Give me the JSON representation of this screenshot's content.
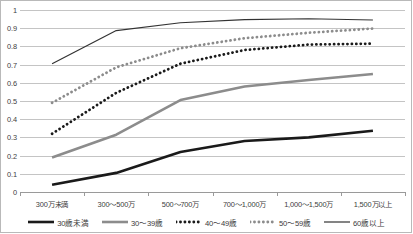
{
  "chart_data": {
    "type": "line",
    "title": "",
    "subtitle": "",
    "xlabel": "",
    "ylabel": "",
    "grid": true,
    "legend_position": "bottom",
    "ylim": [
      0,
      1
    ],
    "ytick_labels": [
      "1",
      "0.9",
      "0.8",
      "0.7",
      "0.6",
      "0.5",
      "0.4",
      "0.3",
      "0.2",
      "0.1",
      "0"
    ],
    "ytick_values": [
      1,
      0.9,
      0.8,
      0.7,
      0.6,
      0.5,
      0.4,
      0.3,
      0.2,
      0.1,
      0
    ],
    "categories": [
      "300万未満",
      "300〜500万",
      "500〜700万",
      "700〜1,000万",
      "1,000〜1,500万",
      "1,500万以上"
    ],
    "series": [
      {
        "name": "30歳未満",
        "values": [
          0.04,
          0.105,
          0.22,
          0.28,
          0.3,
          0.337
        ],
        "color": "#1a1a1a",
        "style": "solid",
        "width": 2.6
      },
      {
        "name": "30〜39歳",
        "values": [
          0.19,
          0.315,
          0.505,
          0.58,
          0.615,
          0.648
        ],
        "color": "#8c8c8c",
        "style": "solid",
        "width": 2.6
      },
      {
        "name": "40〜49歳",
        "values": [
          0.32,
          0.545,
          0.705,
          0.78,
          0.81,
          0.815
        ],
        "color": "#1a1a1a",
        "style": "dotted",
        "width": 2.8
      },
      {
        "name": "50〜59歳",
        "values": [
          0.49,
          0.685,
          0.79,
          0.845,
          0.875,
          0.898
        ],
        "color": "#8c8c8c",
        "style": "dotted",
        "width": 2.8
      },
      {
        "name": "60歳以上",
        "values": [
          0.705,
          0.887,
          0.93,
          0.947,
          0.952,
          0.945
        ],
        "color": "#333333",
        "style": "solid",
        "width": 1.2
      }
    ]
  },
  "colors": {
    "grid": "#c4c4c4",
    "axis": "#9a9a9a",
    "frame": "#b9b9b9",
    "text": "#3a3a3a",
    "background": "#ffffff"
  }
}
